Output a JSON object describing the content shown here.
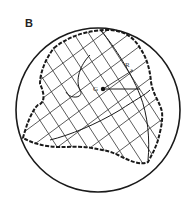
{
  "figure": {
    "panel_label": "B",
    "labels": {
      "center_point": "G",
      "radius_point": "R",
      "radius_subscript": "1"
    },
    "colors": {
      "stroke": "#1a1a1a",
      "hatch": "#333333",
      "background": "#ffffff"
    }
  }
}
